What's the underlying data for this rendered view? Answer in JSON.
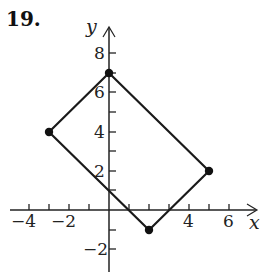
{
  "problem_number": "19.",
  "axes": {
    "x_label": "x",
    "y_label": "y",
    "x_ticks": [
      {
        "value": -4,
        "label": "−4"
      },
      {
        "value": -2,
        "label": "−2"
      },
      {
        "value": 4,
        "label": "4"
      },
      {
        "value": 6,
        "label": "6"
      }
    ],
    "y_ticks": [
      {
        "value": 8,
        "label": "8"
      },
      {
        "value": 6,
        "label": "6"
      },
      {
        "value": 4,
        "label": "4"
      },
      {
        "value": 2,
        "label": "2"
      },
      {
        "value": -2,
        "label": "−2"
      }
    ],
    "x_range": [
      -5,
      7
    ],
    "y_range": [
      -3,
      9
    ]
  },
  "polygon": {
    "type": "rectangle",
    "vertices": [
      [
        0,
        7
      ],
      [
        5,
        2
      ],
      [
        2,
        -1
      ],
      [
        -3,
        4
      ]
    ],
    "color": "#1a1a1a"
  }
}
